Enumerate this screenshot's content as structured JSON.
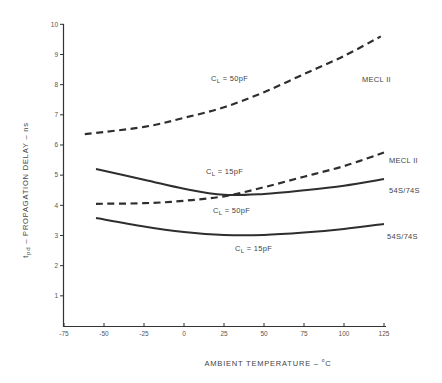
{
  "chart_data": {
    "type": "line",
    "title": "",
    "xlabel": "AMBIENT TEMPERATURE – °C",
    "ylabel": "tpd – PROPAGATION DELAY – ns",
    "xlim": [
      -75,
      125
    ],
    "ylim": [
      0,
      10
    ],
    "x_ticks": [
      -75,
      -50,
      -25,
      0,
      25,
      50,
      75,
      100,
      125
    ],
    "x_tick_labels": [
      "-75",
      "-50",
      "-25",
      "0",
      "25",
      "50",
      "75",
      "100",
      "125"
    ],
    "y_ticks": [
      1,
      2,
      3,
      4,
      5,
      6,
      7,
      8,
      9,
      10
    ],
    "y_tick_labels": [
      "1",
      "2",
      "3",
      "4",
      "5",
      "6",
      "7",
      "8",
      "9",
      "10"
    ],
    "grid": false,
    "legend": "none (inline annotations)",
    "series": [
      {
        "name": "MECL II, CL = 50pF",
        "style": "dashed",
        "x": [
          -62,
          -25,
          0,
          25,
          50,
          75,
          100,
          123
        ],
        "values": [
          6.36,
          6.6,
          6.9,
          7.25,
          7.75,
          8.35,
          8.95,
          9.6
        ]
      },
      {
        "name": "MECL II, CL = 15pF",
        "style": "dashed",
        "x": [
          -55,
          -25,
          0,
          25,
          50,
          75,
          100,
          125
        ],
        "values": [
          4.05,
          4.07,
          4.15,
          4.3,
          4.6,
          4.95,
          5.3,
          5.75
        ]
      },
      {
        "name": "54S/74S, CL = 50pF",
        "style": "solid",
        "x": [
          -55,
          -25,
          0,
          25,
          50,
          75,
          100,
          125
        ],
        "values": [
          5.2,
          4.85,
          4.55,
          4.35,
          4.38,
          4.5,
          4.65,
          4.87
        ]
      },
      {
        "name": "54S/74S, CL = 15pF",
        "style": "solid",
        "x": [
          -55,
          -25,
          0,
          25,
          50,
          75,
          100,
          125
        ],
        "values": [
          3.58,
          3.3,
          3.12,
          3.02,
          3.02,
          3.1,
          3.22,
          3.38
        ]
      }
    ],
    "annotations": [
      {
        "text": "CL = 50pF",
        "near_series": "MECL II, CL = 50pF"
      },
      {
        "text": "MECL II",
        "near_series": "MECL II, CL = 50pF"
      },
      {
        "text": "CL = 15pF",
        "near_series": "54S/74S, CL = 50pF"
      },
      {
        "text": "MECL II",
        "near_series": "MECL II, CL = 15pF"
      },
      {
        "text": "54S/74S",
        "near_series": "54S/74S, CL = 50pF"
      },
      {
        "text": "CL = 50pF",
        "near_series": "MECL II, CL = 15pF"
      },
      {
        "text": "CL = 15pF",
        "near_series": "54S/74S, CL = 15pF"
      },
      {
        "text": "54S/74S",
        "near_series": "54S/74S, CL = 15pF"
      }
    ]
  },
  "labels": {
    "xlabel_main": "AMBIENT TEMPERATURE – ",
    "xlabel_unit_deg": "o",
    "xlabel_unit": "C",
    "ylabel_t": "t",
    "ylabel_sub": "pd",
    "ylabel_rest": " – PROPAGATION DELAY – ns",
    "c": "C",
    "l_sub": "L",
    "a1_val": " = 50pF",
    "a2_text": "MECL II",
    "a3_val": " = 15pF",
    "a4_text": "MECL II",
    "a5_text": "54S/74S",
    "a6_val": " = 50pF",
    "a7_val": " = 15pF",
    "a8_text": "54S/74S"
  }
}
